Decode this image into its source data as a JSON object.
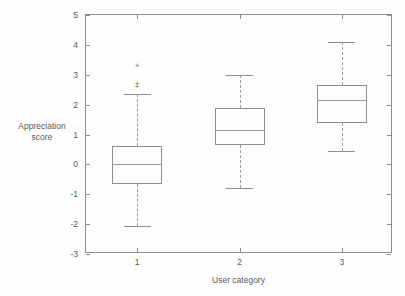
{
  "chart_data": {
    "type": "box",
    "title": "",
    "xlabel": "User category",
    "ylabel": "Appreciation score",
    "categories": [
      "1",
      "2",
      "3"
    ],
    "ylim": [
      -3,
      5
    ],
    "yticks": [
      5,
      4,
      3,
      2,
      1,
      0,
      -1,
      -2,
      -3
    ],
    "ytick_labels": [
      "5",
      "4",
      "3",
      "2",
      "1",
      "0",
      "-1",
      "-2",
      "-3"
    ],
    "xlim": [
      0.5,
      3.5
    ],
    "grid": false,
    "legend": null,
    "frame": "box",
    "boxes": [
      {
        "category": "1",
        "x": 1,
        "whisker_low": -2.05,
        "q1": -0.65,
        "median": 0.0,
        "q3": 0.6,
        "whisker_high": 2.35,
        "outliers": [
          2.6,
          2.68,
          3.3
        ],
        "outlier_marker": "+"
      },
      {
        "category": "2",
        "x": 2,
        "whisker_low": -0.8,
        "q1": 0.65,
        "median": 1.15,
        "q3": 1.9,
        "whisker_high": 3.0,
        "outliers": [],
        "outlier_marker": "+"
      },
      {
        "category": "3",
        "x": 3,
        "whisker_low": 0.45,
        "q1": 1.4,
        "median": 2.15,
        "q3": 2.65,
        "whisker_high": 4.1,
        "outliers": [],
        "outlier_marker": "+"
      }
    ],
    "colors": {
      "axis": "#8e8e8e",
      "box_edge": "#8e8e8e",
      "median": "#9a9a9a",
      "whisker": "#9d9d9d",
      "outlier": "#6a6a6a",
      "background": "#fdfdfd",
      "text": "#5a5a5a"
    },
    "box_width_px": 50
  },
  "axis_titles": {
    "y_line1": "Appreciation",
    "y_line2": "score",
    "x": "User category"
  }
}
